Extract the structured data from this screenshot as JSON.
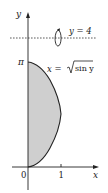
{
  "figure": {
    "axes": {
      "x_label": "x",
      "y_label": "y",
      "origin_label": "0",
      "x_tick_label": "1",
      "y_tick_label": "π"
    },
    "axis_of_rotation": {
      "label": "y = 4",
      "style": "dashed"
    },
    "curve": {
      "label_lhs": "x = ",
      "label_radicand": "sin y",
      "equation": "x = √(sin y)",
      "domain": "0 ≤ y ≤ π"
    },
    "region": {
      "description": "Region between x = √(sin y) and the y-axis, 0 ≤ y ≤ π, rotated about y = 4",
      "fill": "#cfcfcf",
      "stroke": "#222222"
    }
  }
}
